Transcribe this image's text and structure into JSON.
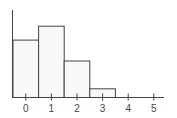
{
  "chart_data": {
    "type": "bar",
    "title": "",
    "xlabel": "",
    "ylabel": "",
    "categories": [
      "0",
      "1",
      "2",
      "3"
    ],
    "values": [
      0.33,
      0.41,
      0.21,
      0.05
    ],
    "xticks": [
      "0",
      "1",
      "2",
      "3",
      "4",
      "5"
    ],
    "xlim": [
      -0.5,
      5.4
    ],
    "ylim": [
      0,
      0.5
    ],
    "grid": false,
    "legend": null,
    "bar_width": 1.0,
    "colors": {
      "bar_fill": "#f8f8f8",
      "bar_edge": "#444444",
      "axis": "#444444"
    }
  }
}
